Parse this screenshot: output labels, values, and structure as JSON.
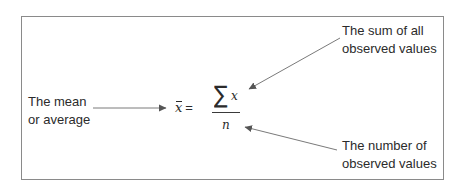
{
  "diagram": {
    "labels": {
      "mean": [
        "The mean",
        "or average"
      ],
      "sum": [
        "The sum of all",
        "observed values"
      ],
      "count": [
        "The number of",
        "observed values"
      ]
    },
    "formula": {
      "lhs_symbol": "x",
      "equals": "=",
      "numerator_operator": "∑",
      "numerator_variable": "x",
      "denominator": "n"
    },
    "arrows": [
      {
        "from": "mean-label",
        "to": "x-bar"
      },
      {
        "from": "sum-label",
        "to": "numerator"
      },
      {
        "from": "count-label",
        "to": "denominator"
      }
    ],
    "colors": {
      "border": "#8a8a8a",
      "text": "#2b2b2b",
      "arrow": "#6e6e6e"
    }
  }
}
